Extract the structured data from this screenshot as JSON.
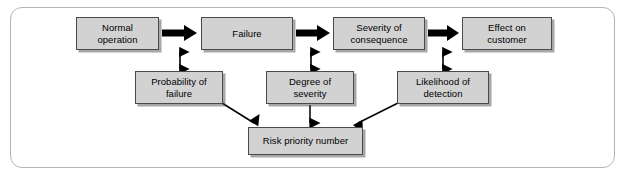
{
  "diagram": {
    "colors": {
      "box_fill": "#d2d2d2",
      "box_border": "#4a4a4a",
      "frame_border": "#b4b4b4",
      "arrow": "#000000",
      "background": "#ffffff"
    },
    "nodes": [
      {
        "id": "normal-operation",
        "label": "Normal\noperation",
        "x": 76,
        "y": 17,
        "w": 83,
        "h": 33
      },
      {
        "id": "failure",
        "label": "Failure",
        "x": 201,
        "y": 17,
        "w": 92,
        "h": 33
      },
      {
        "id": "severity-consequence",
        "label": "Severity of\nconsequence",
        "x": 333,
        "y": 17,
        "w": 92,
        "h": 33
      },
      {
        "id": "effect-customer",
        "label": "Effect on\ncustomer",
        "x": 462,
        "y": 17,
        "w": 90,
        "h": 33
      },
      {
        "id": "probability-failure",
        "label": "Probability of\nfailure",
        "x": 135,
        "y": 71,
        "w": 88,
        "h": 33
      },
      {
        "id": "degree-severity",
        "label": "Degree of\nseverity",
        "x": 266,
        "y": 71,
        "w": 88,
        "h": 33
      },
      {
        "id": "likelihood-detection",
        "label": "Likelihood of\ndetection",
        "x": 397,
        "y": 71,
        "w": 92,
        "h": 33
      },
      {
        "id": "risk-priority-number",
        "label": "Risk priority number",
        "x": 248,
        "y": 127,
        "w": 115,
        "h": 28
      }
    ],
    "block_arrows": [
      {
        "id": "arrow-normal-to-failure",
        "from": "normal-operation",
        "to": "failure",
        "x1": 162,
        "x2": 198,
        "y": 33
      },
      {
        "id": "arrow-failure-to-severity",
        "from": "failure",
        "to": "severity-consequence",
        "x1": 296,
        "x2": 330,
        "y": 33
      },
      {
        "id": "arrow-severity-to-effect",
        "from": "severity-consequence",
        "to": "effect-customer",
        "x1": 428,
        "x2": 459,
        "y": 33
      }
    ],
    "double_arrows": [
      {
        "id": "link-probability-failure",
        "x": 180,
        "y1": 50,
        "y2": 70
      },
      {
        "id": "link-degree-severity",
        "x": 311,
        "y1": 50,
        "y2": 70
      },
      {
        "id": "link-likelihood-detection",
        "x": 443,
        "y1": 50,
        "y2": 70
      }
    ],
    "rpn_connectors": [
      {
        "id": "connector-probability-to-rpn",
        "path": "M 222,103 L 256,125"
      },
      {
        "id": "connector-degree-to-rpn",
        "path": "M 310,104 L 310,125"
      },
      {
        "id": "connector-likelihood-to-rpn",
        "path": "M 398,103 L 356,125"
      }
    ]
  }
}
